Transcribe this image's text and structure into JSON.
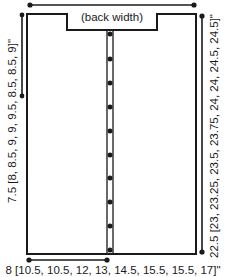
{
  "diagram": {
    "type": "knitting-schematic",
    "labels": {
      "back_width": "(back width)",
      "left_height": "7.5 [8, 8.5, 9, 9, 9.5, 8.5, 8.5, 9]\"",
      "right_height": "22.5 [23, 23.25, 23.5, 23.75, 24, 24, 24.5, 24.5]\"",
      "bottom_width": "8 [10.5, 10.5, 12, 13, 14.5, 15.5, 15.5, 17]\""
    },
    "button_count": 10,
    "colors": {
      "line": "#1a1a1a",
      "background": "#ffffff"
    }
  }
}
